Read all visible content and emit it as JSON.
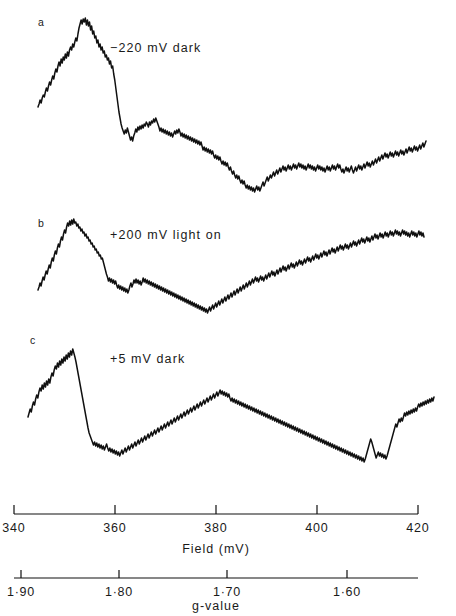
{
  "figure": {
    "background_color": "#ffffff",
    "trace_color": "#101010",
    "axis_color": "#101010"
  },
  "panels": [
    {
      "letter": "a",
      "caption": "−220 mV dark",
      "letter_x": 38,
      "letter_y": 26,
      "caption_x": 110,
      "caption_y": 52
    },
    {
      "letter": "b",
      "caption": "+200 mV light on",
      "letter_x": 38,
      "letter_y": 227,
      "caption_x": 110,
      "caption_y": 239
    },
    {
      "letter": "c",
      "caption": "+5 mV dark",
      "letter_x": 30,
      "letter_y": 344,
      "caption_x": 110,
      "caption_y": 363
    }
  ],
  "field_axis": {
    "name": "Field (mV)",
    "label": "Field (mV)",
    "label_x": 216,
    "label_y": 553,
    "line_y": 514,
    "line_x_start": 14,
    "line_x_end": 418,
    "tick_height": 9,
    "tick_labels": [
      "340",
      "360",
      "380",
      "400",
      "420"
    ],
    "tick_values": [
      340,
      360,
      380,
      400,
      420
    ],
    "tick_x": [
      14,
      115,
      216,
      317,
      418
    ],
    "label_y_text": 532
  },
  "g_axis": {
    "name": "g-value",
    "label": "g-value",
    "label_x": 216,
    "label_y": 610,
    "line_y": 578,
    "line_x_start": 14,
    "line_x_end": 418,
    "tick_height": 8,
    "tick_labels": [
      "1·90",
      "1·80",
      "1·70",
      "1·60"
    ],
    "tick_values": [
      1.9,
      1.8,
      1.7,
      1.6
    ],
    "tick_x": [
      21,
      119,
      227,
      347
    ],
    "label_y_text": 596
  },
  "chart_data": {
    "type": "line",
    "xlabel": "Field (mV)",
    "ylabel": "",
    "xlim": [
      336,
      424
    ],
    "grid": false,
    "legend": "none",
    "secondary_xaxis": {
      "label": "g-value",
      "ticks": [
        1.9,
        1.8,
        1.7,
        1.6
      ]
    },
    "series": [
      {
        "name": "−220 mV dark",
        "panel": "a",
        "baseline_y": 180,
        "x_start": 38,
        "x_end": 426,
        "values": [
          107,
          104,
          100,
          103,
          98,
          95,
          97,
          92,
          88,
          91,
          86,
          82,
          85,
          80,
          76,
          79,
          73,
          69,
          72,
          66,
          62,
          66,
          59,
          63,
          57,
          60,
          54,
          58,
          52,
          56,
          50,
          47,
          50,
          44,
          47,
          42,
          38,
          41,
          34,
          28,
          24,
          20,
          24,
          19,
          22,
          18,
          25,
          20,
          26,
          22,
          30,
          26,
          34,
          31,
          38,
          36,
          43,
          40,
          47,
          44,
          50,
          47,
          53,
          51,
          57,
          55,
          60,
          58,
          64,
          61,
          68,
          66,
          74,
          80,
          88,
          96,
          104,
          112,
          118,
          124,
          128,
          131,
          134,
          130,
          133,
          128,
          132,
          136,
          140,
          137,
          141,
          136,
          133,
          129,
          132,
          127,
          130,
          126,
          129,
          125,
          128,
          124,
          126,
          122,
          124,
          127,
          122,
          125,
          121,
          123,
          119,
          122,
          118,
          121,
          124,
          127,
          131,
          128,
          132,
          129,
          133,
          130,
          134,
          131,
          135,
          132,
          136,
          133,
          137,
          134,
          131,
          134,
          130,
          133,
          129,
          132,
          136,
          133,
          137,
          134,
          138,
          135,
          139,
          136,
          140,
          137,
          141,
          138,
          142,
          139,
          143,
          140,
          144,
          141,
          145,
          142,
          146,
          150,
          147,
          151,
          148,
          152,
          149,
          153,
          150,
          154,
          151,
          155,
          158,
          155,
          159,
          156,
          160,
          157,
          161,
          164,
          161,
          165,
          162,
          166,
          163,
          167,
          170,
          167,
          171,
          174,
          171,
          175,
          178,
          175,
          179,
          176,
          180,
          183,
          180,
          184,
          181,
          185,
          188,
          185,
          189,
          186,
          190,
          187,
          191,
          188,
          192,
          189,
          186,
          190,
          187,
          191,
          188,
          185,
          182,
          186,
          183,
          180,
          177,
          181,
          178,
          175,
          178,
          175,
          172,
          176,
          173,
          170,
          174,
          171,
          168,
          172,
          169,
          166,
          170,
          167,
          171,
          168,
          165,
          169,
          166,
          170,
          167,
          164,
          168,
          165,
          169,
          166,
          163,
          167,
          164,
          168,
          165,
          169,
          166,
          170,
          167,
          164,
          168,
          165,
          169,
          166,
          170,
          167,
          171,
          168,
          165,
          169,
          166,
          170,
          167,
          171,
          168,
          172,
          169,
          166,
          170,
          167,
          171,
          168,
          165,
          169,
          166,
          170,
          167,
          164,
          168,
          165,
          169,
          172,
          169,
          173,
          170,
          167,
          171,
          168,
          172,
          169,
          166,
          170,
          173,
          170,
          167,
          171,
          168,
          165,
          169,
          166,
          170,
          167,
          164,
          168,
          165,
          162,
          166,
          163,
          167,
          164,
          161,
          165,
          162,
          159,
          163,
          160,
          157,
          161,
          158,
          155,
          159,
          156,
          153,
          157,
          154,
          158,
          155,
          152,
          156,
          153,
          157,
          154,
          151,
          155,
          152,
          156,
          153,
          150,
          154,
          151,
          155,
          152,
          149,
          153,
          150,
          147,
          151,
          148,
          152,
          149,
          146,
          150,
          147,
          151,
          148,
          145,
          149,
          146,
          143,
          147,
          144,
          141
        ]
      },
      {
        "name": "+200 mV light on",
        "panel": "b",
        "baseline_y": 300,
        "x_start": 38,
        "x_end": 424,
        "values": [
          290,
          287,
          283,
          286,
          281,
          277,
          280,
          275,
          271,
          274,
          269,
          265,
          268,
          262,
          258,
          261,
          255,
          251,
          254,
          248,
          244,
          247,
          241,
          237,
          240,
          234,
          230,
          233,
          227,
          223,
          226,
          221,
          225,
          220,
          224,
          219,
          223,
          222,
          226,
          224,
          228,
          227,
          231,
          229,
          233,
          232,
          236,
          234,
          238,
          237,
          241,
          240,
          244,
          243,
          247,
          246,
          250,
          249,
          253,
          252,
          256,
          255,
          259,
          258,
          262,
          266,
          270,
          274,
          277,
          281,
          278,
          282,
          279,
          283,
          280,
          284,
          281,
          285,
          288,
          285,
          289,
          286,
          290,
          287,
          291,
          288,
          292,
          289,
          293,
          290,
          286,
          283,
          287,
          284,
          280,
          283,
          279,
          283,
          280,
          284,
          281,
          285,
          282,
          278,
          282,
          279,
          283,
          280,
          284,
          281,
          285,
          282,
          286,
          283,
          287,
          284,
          288,
          285,
          289,
          286,
          290,
          287,
          291,
          288,
          292,
          289,
          293,
          290,
          294,
          291,
          295,
          292,
          296,
          293,
          297,
          294,
          298,
          295,
          299,
          296,
          300,
          297,
          301,
          298,
          302,
          299,
          303,
          300,
          304,
          301,
          305,
          302,
          306,
          303,
          307,
          304,
          308,
          305,
          309,
          306,
          310,
          307,
          311,
          308,
          312,
          309,
          313,
          310,
          307,
          311,
          308,
          305,
          309,
          306,
          303,
          307,
          304,
          301,
          305,
          302,
          299,
          303,
          300,
          297,
          301,
          298,
          295,
          299,
          296,
          293,
          297,
          294,
          291,
          295,
          292,
          289,
          293,
          290,
          287,
          291,
          288,
          285,
          289,
          286,
          283,
          287,
          284,
          281,
          285,
          282,
          279,
          283,
          280,
          277,
          281,
          278,
          282,
          279,
          276,
          280,
          277,
          281,
          278,
          275,
          279,
          276,
          273,
          277,
          274,
          271,
          275,
          272,
          276,
          273,
          270,
          274,
          271,
          268,
          272,
          269,
          266,
          270,
          267,
          271,
          268,
          265,
          269,
          266,
          263,
          267,
          264,
          268,
          265,
          262,
          266,
          263,
          260,
          264,
          261,
          265,
          262,
          259,
          263,
          260,
          257,
          261,
          258,
          262,
          259,
          256,
          260,
          257,
          254,
          258,
          255,
          259,
          256,
          253,
          257,
          254,
          251,
          255,
          252,
          256,
          253,
          250,
          254,
          251,
          248,
          252,
          249,
          253,
          250,
          247,
          251,
          248,
          245,
          249,
          246,
          250,
          247,
          244,
          248,
          245,
          249,
          246,
          243,
          247,
          244,
          241,
          245,
          242,
          246,
          243,
          240,
          244,
          241,
          238,
          242,
          239,
          243,
          240,
          237,
          241,
          238,
          242,
          239,
          236,
          240,
          237,
          234,
          238,
          235,
          239,
          236,
          233,
          237,
          234,
          238,
          235,
          232,
          236,
          233,
          237,
          234,
          231,
          235,
          232,
          236,
          233,
          230,
          234,
          231,
          235,
          232,
          236,
          233,
          230,
          234,
          231,
          235,
          232,
          236,
          233,
          237,
          234,
          231,
          235,
          232,
          236,
          233,
          237,
          234,
          231,
          235,
          232,
          236,
          233,
          237
        ]
      },
      {
        "name": "+5 mV dark",
        "panel": "c",
        "baseline_y": 430,
        "x_start": 28,
        "x_end": 434,
        "values": [
          417,
          413,
          409,
          412,
          406,
          402,
          405,
          399,
          395,
          398,
          392,
          388,
          391,
          385,
          389,
          383,
          387,
          381,
          385,
          379,
          383,
          377,
          373,
          376,
          370,
          366,
          369,
          363,
          367,
          361,
          365,
          359,
          363,
          357,
          361,
          355,
          359,
          353,
          357,
          351,
          355,
          349,
          353,
          357,
          362,
          368,
          374,
          380,
          386,
          392,
          398,
          404,
          410,
          416,
          422,
          428,
          433,
          436,
          439,
          442,
          445,
          442,
          446,
          443,
          447,
          444,
          448,
          445,
          449,
          446,
          450,
          447,
          444,
          448,
          451,
          448,
          452,
          449,
          453,
          450,
          454,
          451,
          455,
          452,
          456,
          453,
          450,
          454,
          451,
          448,
          452,
          449,
          446,
          450,
          447,
          444,
          448,
          445,
          442,
          446,
          443,
          440,
          444,
          441,
          438,
          442,
          439,
          436,
          440,
          437,
          434,
          438,
          435,
          432,
          436,
          433,
          430,
          434,
          431,
          428,
          432,
          429,
          426,
          430,
          427,
          424,
          428,
          425,
          422,
          426,
          423,
          420,
          424,
          421,
          418,
          422,
          419,
          416,
          420,
          417,
          414,
          418,
          415,
          412,
          416,
          413,
          410,
          414,
          411,
          408,
          412,
          409,
          406,
          410,
          407,
          404,
          408,
          405,
          402,
          406,
          403,
          400,
          404,
          401,
          398,
          402,
          399,
          396,
          400,
          397,
          394,
          398,
          395,
          392,
          396,
          393,
          390,
          394,
          391,
          395,
          392,
          396,
          393,
          397,
          394,
          398,
          401,
          398,
          402,
          399,
          403,
          400,
          404,
          401,
          405,
          402,
          406,
          403,
          407,
          404,
          408,
          405,
          409,
          406,
          410,
          407,
          411,
          408,
          412,
          409,
          413,
          410,
          414,
          411,
          415,
          412,
          416,
          413,
          417,
          414,
          418,
          415,
          419,
          416,
          420,
          417,
          421,
          418,
          422,
          419,
          423,
          420,
          424,
          421,
          425,
          422,
          426,
          423,
          427,
          424,
          428,
          425,
          429,
          426,
          430,
          427,
          431,
          428,
          432,
          429,
          433,
          430,
          434,
          431,
          435,
          432,
          436,
          433,
          437,
          434,
          438,
          435,
          439,
          436,
          440,
          437,
          441,
          438,
          442,
          439,
          443,
          440,
          444,
          441,
          445,
          442,
          446,
          443,
          447,
          444,
          448,
          445,
          449,
          446,
          450,
          447,
          451,
          448,
          452,
          449,
          453,
          450,
          454,
          451,
          455,
          452,
          456,
          453,
          457,
          454,
          458,
          455,
          459,
          456,
          460,
          457,
          461,
          458,
          462,
          459,
          455,
          451,
          447,
          443,
          439,
          442,
          446,
          450,
          454,
          458,
          455,
          452,
          456,
          453,
          457,
          454,
          458,
          455,
          459,
          456,
          452,
          448,
          444,
          440,
          436,
          432,
          428,
          424,
          427,
          423,
          419,
          422,
          418,
          421,
          417,
          413,
          416,
          412,
          415,
          411,
          414,
          410,
          413,
          409,
          412,
          408,
          411,
          407,
          404,
          407,
          403,
          406,
          402,
          405,
          401,
          404,
          400,
          403,
          399,
          402,
          398,
          401,
          397
        ]
      }
    ]
  }
}
